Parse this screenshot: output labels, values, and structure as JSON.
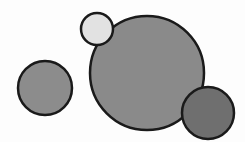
{
  "diagram": {
    "width": 245,
    "height": 142,
    "background": "#fdfdfd",
    "stroke_color": "#1a1a1a",
    "stroke_width": 2.5,
    "circles": [
      {
        "id": "big-circle",
        "cx": 147,
        "cy": 73,
        "r": 57,
        "fill": "#8a8a8a"
      },
      {
        "id": "left-circle",
        "cx": 45,
        "cy": 88,
        "r": 27,
        "fill": "#8c8c8c"
      },
      {
        "id": "small-light-circle",
        "cx": 97,
        "cy": 29,
        "r": 16,
        "fill": "#e2e2e2"
      },
      {
        "id": "bottom-right-dark-circle",
        "cx": 208,
        "cy": 113,
        "r": 26,
        "fill": "#6f6f6f"
      }
    ]
  }
}
